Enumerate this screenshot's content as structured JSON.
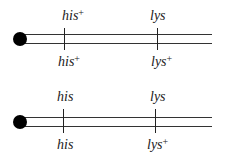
{
  "diagram": {
    "type": "chromosome-genotype",
    "chromosomes": [
      {
        "name": "top-chromosome",
        "loci": [
          {
            "gene": "his",
            "top_label": "his",
            "top_sup": "+",
            "bottom_label": "his",
            "bottom_sup": "+"
          },
          {
            "gene": "lys",
            "top_label": "lys",
            "top_sup": "",
            "bottom_label": "lys",
            "bottom_sup": "+"
          }
        ]
      },
      {
        "name": "bottom-chromosome",
        "loci": [
          {
            "gene": "his",
            "top_label": "his",
            "top_sup": "",
            "bottom_label": "his",
            "bottom_sup": ""
          },
          {
            "gene": "lys",
            "top_label": "lys",
            "top_sup": "",
            "bottom_label": "lys",
            "bottom_sup": "+"
          }
        ]
      }
    ],
    "colors": {
      "line": "#333333",
      "centromere": "#000000",
      "text": "#222222"
    }
  }
}
